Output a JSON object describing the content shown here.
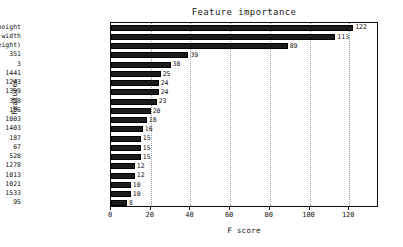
{
  "chart_data": {
    "type": "bar",
    "orientation": "horizontal",
    "title": "Feature importance",
    "xlabel": "F score",
    "ylabel": "Features",
    "xlim": [
      0,
      135
    ],
    "ylim": [
      0,
      20
    ],
    "grid": true,
    "grid_axis": "x",
    "legend": false,
    "bar_color": "#1b1b1b",
    "xticks": [
      0,
      20,
      40,
      60,
      80,
      100,
      120
    ],
    "xticklabels": [
      "0",
      "20",
      "40",
      "60",
      "80",
      "100",
      "120"
    ],
    "categories": [
      "height",
      "width",
      "ratio(width/height)",
      "351",
      "3",
      "1441",
      "1243",
      "1399",
      "398",
      "106",
      "1003",
      "1403",
      "187",
      "67",
      "520",
      "1278",
      "1013",
      "1021",
      "1533",
      "95"
    ],
    "values": [
      122,
      113,
      89,
      39,
      30,
      25,
      24,
      24,
      23,
      20,
      18,
      16,
      15,
      15,
      15,
      12,
      12,
      10,
      10,
      8
    ],
    "value_labels": [
      "122",
      "113",
      "89",
      "39",
      "30",
      "25",
      "24",
      "24",
      "23",
      "20",
      "18",
      "16",
      "15",
      "15",
      "15",
      "12",
      "12",
      "10",
      "10",
      "8"
    ]
  }
}
